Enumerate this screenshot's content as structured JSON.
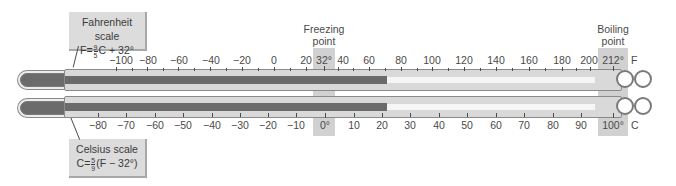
{
  "callouts": {
    "fahrenheit": {
      "title": "Fahrenheit scale",
      "formula_prefix": "F=",
      "frac_num": "9",
      "frac_den": "5",
      "formula_suffix": "C + 32°"
    },
    "celsius": {
      "title": "Celsius scale",
      "formula_prefix": "C=",
      "frac_num": "5",
      "frac_den": "9",
      "formula_suffix": "(F − 32°)"
    }
  },
  "freezing": {
    "line1": "Freezing",
    "line2": "point",
    "f_value": "32°",
    "c_value": "0°"
  },
  "boiling": {
    "line1": "Boiling",
    "line2": "point",
    "f_value": "212°",
    "c_value": "100°"
  },
  "units": {
    "f": "F",
    "c": "C"
  },
  "fahrenheit_labels": [
    "−100",
    "−80",
    "−60",
    "−40",
    "−20",
    "0",
    "20",
    "40",
    "60",
    "80",
    "100",
    "120",
    "140",
    "160",
    "180",
    "200"
  ],
  "celsius_labels": [
    "−80",
    "−70",
    "−60",
    "−50",
    "−40",
    "−30",
    "−20",
    "−10",
    "10",
    "20",
    "30",
    "40",
    "50",
    "60",
    "70",
    "80",
    "90"
  ],
  "reading": {
    "celsius": "21",
    "fahrenheit": "70"
  },
  "colors": {
    "mercury": "#6b6b6b",
    "band": "#c9c9c9",
    "callout_bg": "#dcdcdc"
  }
}
